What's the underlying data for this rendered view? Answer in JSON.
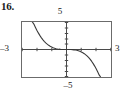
{
  "figure": {
    "problem_number": "16.",
    "kind": "graphing-calculator-viewing-window"
  },
  "axis_labels": {
    "y_max": "5",
    "y_min": "–5",
    "x_min": "–3",
    "x_max": "3"
  },
  "chart_data": {
    "type": "line",
    "title": "",
    "subtitle": "",
    "xlabel": "",
    "ylabel": "",
    "grid": false,
    "legend": false,
    "legend_position": "none",
    "xlim": [
      -3,
      3
    ],
    "ylim": [
      -5,
      5
    ],
    "xticks": [
      -3,
      -2,
      -1,
      0,
      1,
      2,
      3
    ],
    "yticks": [
      -5,
      -4,
      -3,
      -2,
      -1,
      0,
      1,
      2,
      3,
      4,
      5
    ],
    "xtick_labels": [
      "–3",
      "",
      "",
      "",
      "",
      "",
      "3"
    ],
    "ytick_labels": [
      "–5",
      "",
      "",
      "",
      "",
      "",
      "",
      "",
      "",
      "",
      "5"
    ],
    "tick_spacing": {
      "x": 1,
      "y": 1
    },
    "axes_drawn": {
      "x_axis_y": 0,
      "y_axis_x": 0
    },
    "series": [
      {
        "name": "curve",
        "description": "decreasing odd function through the origin",
        "color": "#3a3a3a",
        "x": [
          -2.3,
          -2.2,
          -2.1,
          -2.0,
          -1.9,
          -1.8,
          -1.7,
          -1.6,
          -1.5,
          -1.4,
          -1.3,
          -1.2,
          -1.1,
          -1.0,
          -0.9,
          -0.8,
          -0.7,
          -0.6,
          -0.5,
          -0.4,
          -0.3,
          -0.2,
          -0.1,
          0.0,
          0.1,
          0.2,
          0.3,
          0.4,
          0.5,
          0.6,
          0.7,
          0.8,
          0.9,
          1.0,
          1.1,
          1.2,
          1.3,
          1.4,
          1.5,
          1.6,
          1.7,
          1.8,
          1.9,
          2.0,
          2.1,
          2.2,
          2.3
        ],
        "y": [
          5.0,
          4.62,
          4.06,
          3.52,
          3.02,
          2.57,
          2.17,
          1.8,
          1.48,
          1.21,
          0.97,
          0.76,
          0.59,
          0.44,
          0.32,
          0.23,
          0.15,
          0.1,
          0.06,
          0.03,
          0.01,
          0.0,
          0.0,
          0.0,
          0.0,
          0.0,
          -0.01,
          -0.03,
          -0.06,
          -0.1,
          -0.15,
          -0.23,
          -0.32,
          -0.44,
          -0.59,
          -0.76,
          -0.97,
          -1.21,
          -1.48,
          -1.8,
          -2.17,
          -2.57,
          -3.02,
          -3.52,
          -4.06,
          -4.62,
          -5.0
        ]
      }
    ],
    "annotations": []
  },
  "colors": {
    "frame": "#6b6b6b",
    "axis": "#4a4a4a",
    "curve": "#3a3a3a",
    "text": "#1a1a1a",
    "background": "#ffffff"
  }
}
